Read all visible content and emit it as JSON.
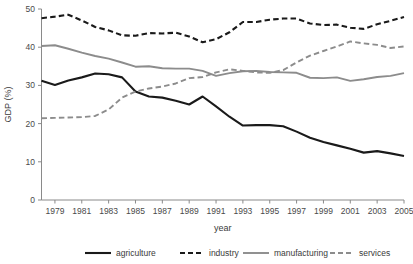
{
  "chart_data": {
    "type": "line",
    "title": "",
    "xlabel": "year",
    "ylabel": "GDP (%)",
    "xlim": [
      1978,
      2005
    ],
    "ylim": [
      0,
      50
    ],
    "grid": false,
    "legend_position": "bottom",
    "x": [
      1978,
      1979,
      1980,
      1981,
      1982,
      1983,
      1984,
      1985,
      1986,
      1987,
      1988,
      1989,
      1990,
      1991,
      1992,
      1993,
      1994,
      1995,
      1996,
      1997,
      1998,
      1999,
      2000,
      2001,
      2002,
      2003,
      2004,
      2005
    ],
    "xticks": [
      1979,
      1981,
      1983,
      1985,
      1987,
      1989,
      1991,
      1993,
      1995,
      1997,
      1999,
      2001,
      2003,
      2005
    ],
    "xtick_labels": [
      "1979",
      "1981",
      "1983",
      "1985",
      "1987",
      "1989",
      "1991",
      "1993",
      "1995",
      "1997",
      "1999",
      "2001",
      "2003",
      "2005"
    ],
    "yticks": [
      0,
      10,
      20,
      30,
      40,
      50
    ],
    "ytick_labels": [
      "0",
      "10",
      "20",
      "30",
      "40",
      "50"
    ],
    "series": [
      {
        "name": "agriculture",
        "color": "#1a1a1a",
        "style": "solid",
        "width": 2.1,
        "values": [
          31.2,
          30.1,
          31.3,
          32.1,
          33.1,
          32.9,
          32.1,
          28.4,
          27.1,
          26.8,
          26.0,
          25.0,
          27.1,
          24.5,
          21.8,
          19.5,
          19.6,
          19.6,
          19.3,
          17.9,
          16.3,
          15.2,
          14.3,
          13.4,
          12.4,
          12.8,
          12.2,
          11.5
        ]
      },
      {
        "name": "industry",
        "color": "#1a1a1a",
        "style": "dashed",
        "width": 2.1,
        "values": [
          47.6,
          48.0,
          48.5,
          47.0,
          45.3,
          44.4,
          43.1,
          43.0,
          43.7,
          43.6,
          43.8,
          42.8,
          41.3,
          42.1,
          43.9,
          46.6,
          46.6,
          47.2,
          47.5,
          47.5,
          46.2,
          45.8,
          45.9,
          45.1,
          44.8,
          46.0,
          46.9,
          47.9
        ]
      },
      {
        "name": "manufacturing",
        "color": "#8c8c8c",
        "style": "solid",
        "width": 1.9,
        "values": [
          40.3,
          40.5,
          39.6,
          38.6,
          37.7,
          37.0,
          36.0,
          34.9,
          35.0,
          34.5,
          34.4,
          34.4,
          33.8,
          32.5,
          33.2,
          33.7,
          33.8,
          33.5,
          33.4,
          33.3,
          32.0,
          31.9,
          32.1,
          31.2,
          31.6,
          32.2,
          32.5,
          33.2
        ]
      },
      {
        "name": "services",
        "color": "#8c8c8c",
        "style": "dashed",
        "width": 1.9,
        "values": [
          21.4,
          21.5,
          21.6,
          21.7,
          22.0,
          23.7,
          26.8,
          28.4,
          29.2,
          29.7,
          30.5,
          31.9,
          32.2,
          33.4,
          34.2,
          33.8,
          33.4,
          33.3,
          34.0,
          36.0,
          37.8,
          39.0,
          40.2,
          41.5,
          41.0,
          40.6,
          39.8,
          40.2
        ]
      }
    ]
  },
  "legend": {
    "items": [
      {
        "label": "agriculture"
      },
      {
        "label": "industry"
      },
      {
        "label": "manufacturing"
      },
      {
        "label": "services"
      }
    ]
  }
}
